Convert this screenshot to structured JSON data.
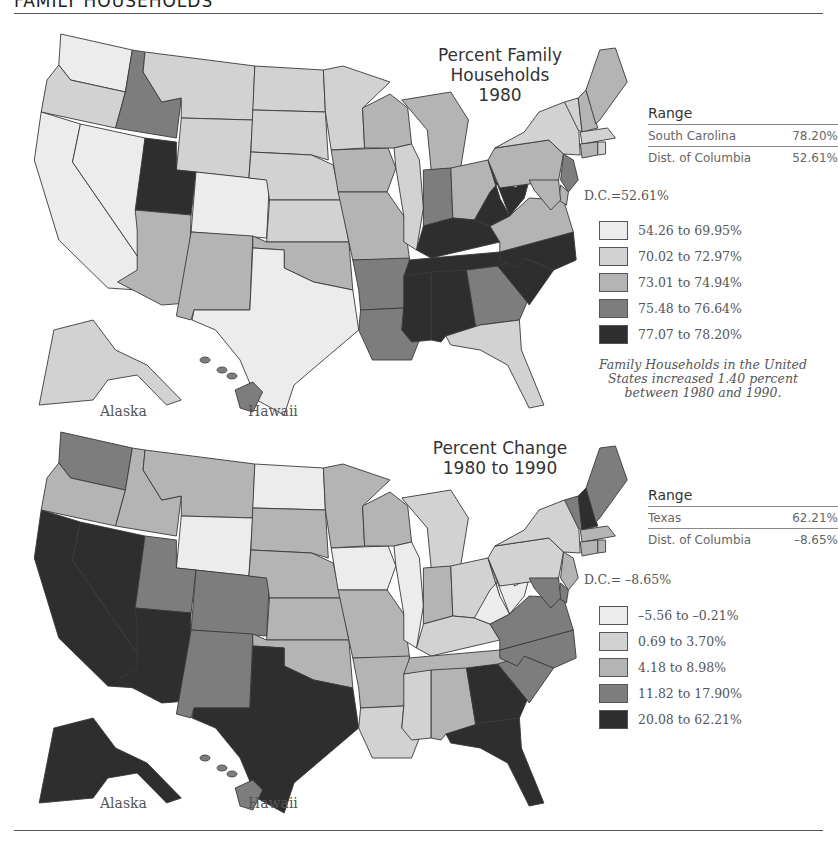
{
  "header": {
    "title": "FAMILY HOUSEHOLDS"
  },
  "colors": {
    "c1": "#ececec",
    "c2": "#d2d2d2",
    "c3": "#b4b4b4",
    "c4": "#7d7d7d",
    "c5": "#2e2e2e",
    "rule": "#555555",
    "text": "#555555"
  },
  "maps": [
    {
      "title_lines": [
        "Percent Family",
        "Households",
        "1980"
      ],
      "range": {
        "title": "Range",
        "rows": [
          {
            "label": "South Carolina",
            "value": "78.20%"
          },
          {
            "label": "Dist. of Columbia",
            "value": "52.61%"
          }
        ]
      },
      "dc_note": "D.C.=52.61%",
      "legend": [
        {
          "label": "54.26 to 69.95%",
          "class": 1
        },
        {
          "label": "70.02 to 72.97%",
          "class": 2
        },
        {
          "label": "73.01 to 74.94%",
          "class": 3
        },
        {
          "label": "75.48 to 76.64%",
          "class": 4
        },
        {
          "label": "77.07 to 78.20%",
          "class": 5
        }
      ],
      "note": "Family Households in the United States increased 1.40 percent between 1980 and 1990.",
      "inset_labels": {
        "alaska": "Alaska",
        "hawaii": "Hawaii"
      }
    },
    {
      "title_lines": [
        "Percent Change",
        "1980 to 1990"
      ],
      "range": {
        "title": "Range",
        "rows": [
          {
            "label": "Texas",
            "value": "62.21%"
          },
          {
            "label": "Dist. of Columbia",
            "value": "–8.65%"
          }
        ]
      },
      "dc_note": "D.C.= –8.65%",
      "legend": [
        {
          "label": "–5.56 to –0.21%",
          "class": 1
        },
        {
          "label": "0.69 to 3.70%",
          "class": 2
        },
        {
          "label": "4.18 to 8.98%",
          "class": 3
        },
        {
          "label": "11.82 to 17.90%",
          "class": 4
        },
        {
          "label": "20.08 to 62.21%",
          "class": 5
        }
      ],
      "inset_labels": {
        "alaska": "Alaska",
        "hawaii": "Hawaii"
      }
    }
  ],
  "chart_data": [
    {
      "type": "choropleth",
      "title": "Percent Family Households 1980",
      "range_high": {
        "state": "South Carolina",
        "value": 78.2
      },
      "range_low": {
        "state": "Dist. of Columbia",
        "value": 52.61
      },
      "classes": [
        "54.26 to 69.95%",
        "70.02 to 72.97%",
        "73.01 to 74.94%",
        "75.48 to 76.64%",
        "77.07 to 78.20%"
      ],
      "state_class": {
        "WA": 1,
        "OR": 2,
        "CA": 1,
        "NV": 1,
        "ID": 4,
        "MT": 2,
        "WY": 2,
        "UT": 5,
        "CO": 1,
        "AZ": 3,
        "NM": 3,
        "ND": 2,
        "SD": 2,
        "NE": 2,
        "KS": 2,
        "OK": 3,
        "TX": 1,
        "MN": 2,
        "IA": 3,
        "MO": 3,
        "AR": 4,
        "LA": 4,
        "WI": 3,
        "IL": 2,
        "MI": 3,
        "IN": 4,
        "OH": 3,
        "KY": 5,
        "TN": 5,
        "MS": 5,
        "AL": 5,
        "GA": 4,
        "FL": 2,
        "SC": 5,
        "NC": 5,
        "VA": 3,
        "WV": 5,
        "PA": 3,
        "NY": 2,
        "VT": 2,
        "NH": 3,
        "ME": 3,
        "MA": 2,
        "CT": 3,
        "RI": 2,
        "NJ": 4,
        "DE": 3,
        "MD": 3,
        "AK": 2,
        "HI": 4
      }
    },
    {
      "type": "choropleth",
      "title": "Percent Change 1980 to 1990",
      "range_high": {
        "state": "Texas",
        "value": 62.21
      },
      "range_low": {
        "state": "Dist. of Columbia",
        "value": -8.65
      },
      "classes": [
        "-5.56 to -0.21%",
        "0.69 to 3.70%",
        "4.18 to 8.98%",
        "11.82 to 17.90%",
        "20.08 to 62.21%"
      ],
      "state_class": {
        "WA": 4,
        "OR": 3,
        "CA": 5,
        "NV": 5,
        "ID": 3,
        "MT": 3,
        "WY": 1,
        "UT": 4,
        "CO": 4,
        "AZ": 5,
        "NM": 4,
        "ND": 1,
        "SD": 3,
        "NE": 3,
        "KS": 3,
        "OK": 3,
        "TX": 5,
        "MN": 3,
        "IA": 1,
        "MO": 3,
        "AR": 3,
        "LA": 2,
        "WI": 3,
        "IL": 1,
        "MI": 2,
        "IN": 3,
        "OH": 2,
        "KY": 2,
        "TN": 3,
        "MS": 2,
        "AL": 3,
        "GA": 5,
        "FL": 5,
        "SC": 4,
        "NC": 4,
        "VA": 4,
        "WV": 1,
        "PA": 2,
        "NY": 2,
        "VT": 4,
        "NH": 5,
        "ME": 4,
        "MA": 3,
        "CT": 3,
        "RI": 3,
        "NJ": 3,
        "DE": 4,
        "MD": 4,
        "AK": 5,
        "HI": 4
      }
    }
  ]
}
